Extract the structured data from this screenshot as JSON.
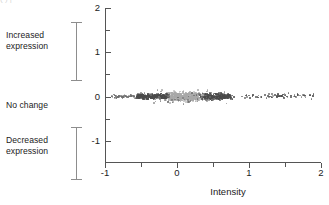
{
  "figure": {
    "top_artifact_text": "( )            |",
    "annotations": [
      {
        "id": "increased",
        "label": "Increased\nexpression"
      },
      {
        "id": "nochange",
        "label": "No change"
      },
      {
        "id": "decreased",
        "label": "Decreased\nexpression"
      }
    ],
    "brackets": [
      {
        "id": "increased",
        "name": "increased-expression-bracket"
      },
      {
        "id": "decreased",
        "name": "decreased-expression-bracket"
      }
    ]
  },
  "colors": {
    "axis": "#555555",
    "text": "#222222",
    "bracket": "#8d8d8d",
    "dot_dark": "#4a4a4a",
    "dot_mid": "#6e6e6e",
    "dot_light": "#a8a8a8",
    "background": "#ffffff"
  },
  "chart_data": {
    "type": "scatter",
    "title": "",
    "xlabel": "Intensity",
    "ylabel": "",
    "xlim": [
      -1,
      2
    ],
    "ylim": [
      -1.5,
      2
    ],
    "grid": false,
    "legend": null,
    "xticks": [
      -1,
      0,
      1,
      2
    ],
    "xticklabels": [
      "-1",
      "0",
      "1",
      "2"
    ],
    "xminorticks": [
      -0.5,
      0.5,
      1.5
    ],
    "yticks": [
      -1,
      0,
      1,
      2
    ],
    "yticklabels": [
      "-1",
      "0",
      "1",
      "2"
    ],
    "yminorticks": [
      -0.5,
      0.5,
      1.5
    ],
    "clusters": [
      {
        "name": "saturated-core",
        "color": "#a8a8a8",
        "x_range": [
          -0.18,
          0.38
        ],
        "y_range": [
          -0.14,
          0.13
        ],
        "n": 520,
        "dot_size": 1.6
      },
      {
        "name": "dense-band-left",
        "color": "#4a4a4a",
        "x_range": [
          -0.62,
          -0.1
        ],
        "y_range": [
          -0.09,
          0.09
        ],
        "n": 330,
        "dot_size": 1.5
      },
      {
        "name": "dense-band-right",
        "color": "#4a4a4a",
        "x_range": [
          0.3,
          0.78
        ],
        "y_range": [
          -0.1,
          0.1
        ],
        "n": 300,
        "dot_size": 1.5
      },
      {
        "name": "left-tail",
        "color": "#6e6e6e",
        "x_range": [
          -0.92,
          -0.58
        ],
        "y_range": [
          -0.05,
          0.06
        ],
        "n": 70,
        "dot_size": 1.4
      },
      {
        "name": "right-tail",
        "color": "#4a4a4a",
        "x_range": [
          0.78,
          2.0
        ],
        "y_range": [
          -0.08,
          0.1
        ],
        "n": 70,
        "dot_size": 1.5
      },
      {
        "name": "outliers-scatter",
        "color": "#6e6e6e",
        "x_range": [
          -0.45,
          0.75
        ],
        "y_range": [
          -0.3,
          0.26
        ],
        "n": 55,
        "dot_size": 1.4
      }
    ],
    "points_note": "Individual point coordinates are generated from the cluster definitions above; the figure depicts ~1345 spots."
  }
}
